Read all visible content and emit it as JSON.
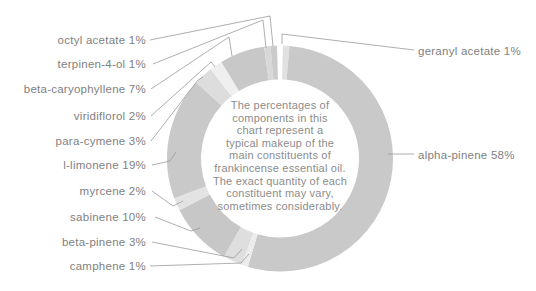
{
  "chart_data": {
    "type": "donut",
    "unit": "%",
    "clockwise_from_top": true,
    "start_gap_degrees": 3,
    "legend_position": "callout-labels",
    "segments": [
      {
        "name": "geranyl acetate",
        "value": 1,
        "label": "geranyl acetate 1%",
        "color": "#e1e1e1",
        "label_side": "right"
      },
      {
        "name": "alpha-pinene",
        "value": 58,
        "label": "alpha-pinene 58%",
        "color": "#c9c9c9",
        "label_side": "right"
      },
      {
        "name": "camphene",
        "value": 1,
        "label": "camphene 1%",
        "color": "#ececec",
        "label_side": "left"
      },
      {
        "name": "beta-pinene",
        "value": 3,
        "label": "beta-pinene 3%",
        "color": "#dedede",
        "label_side": "left"
      },
      {
        "name": "sabinene",
        "value": 10,
        "label": "sabinene 10%",
        "color": "#c7c7c7",
        "label_side": "left"
      },
      {
        "name": "myrcene",
        "value": 2,
        "label": "myrcene 2%",
        "color": "#e3e3e3",
        "label_side": "left"
      },
      {
        "name": "l-limonene",
        "value": 19,
        "label": "l-limonene 19%",
        "color": "#c9c9c9",
        "label_side": "left"
      },
      {
        "name": "para-cymene",
        "value": 3,
        "label": "para-cymene 3%",
        "color": "#dddddd",
        "label_side": "left"
      },
      {
        "name": "viridiflorol",
        "value": 2,
        "label": "viridiflorol 2%",
        "color": "#efefef",
        "label_side": "left"
      },
      {
        "name": "beta-caryophyllene",
        "value": 7,
        "label": "beta-caryophyllene 7%",
        "color": "#c8c8c8",
        "label_side": "left"
      },
      {
        "name": "terpinen-4-ol",
        "value": 1,
        "label": "terpinen-4-ol 1%",
        "color": "#d8d8d8",
        "label_side": "left"
      },
      {
        "name": "octyl acetate",
        "value": 1,
        "label": "octyl acetate 1%",
        "color": "#cbcbcb",
        "label_side": "left"
      }
    ],
    "center_note_lines": [
      "The percentages of",
      "components in this",
      "chart represent a",
      "typical makeup of the",
      "main constituents of",
      "frankincense essential oil.",
      "The exact quantity of each",
      "constituent may vary,",
      "sometimes considerably."
    ],
    "colors": {
      "background": "#ffffff",
      "leader_line": "#9b9b9b",
      "label_text": "#7f7f7f",
      "note_text": "#8c8c8c"
    }
  }
}
